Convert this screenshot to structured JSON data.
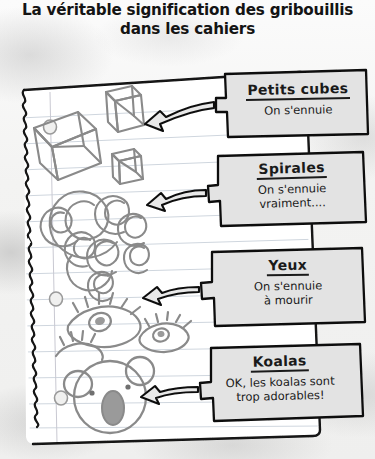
{
  "title": {
    "line1": "La véritable signification des gribouillis",
    "line2": "dans les cahiers",
    "full": "La véritable signification des gribouillis\ndans les cahiers"
  },
  "colors": {
    "ink": "#1a1a1a",
    "pencil": "#8a8a8a",
    "rule_line": "#cfd6de",
    "margin_line": "#c9c9d2",
    "paper": "#ffffff",
    "box_fill": "#e3e3e3",
    "background": "#f2f2f1"
  },
  "notebook": {
    "name": "torn-notebook-page",
    "ruled_lines": 13,
    "punch_holes": 2,
    "torn_edge": "left"
  },
  "doodles": [
    {
      "id": "cubes",
      "name": "cube-doodle",
      "label": "Petits cubes",
      "count": 3
    },
    {
      "id": "spirals",
      "name": "spiral-doodle",
      "label": "Spirales",
      "count": 9
    },
    {
      "id": "eyes",
      "name": "eye-doodle",
      "label": "Yeux",
      "count": 3
    },
    {
      "id": "koala",
      "name": "koala-doodle",
      "label": "Koalas",
      "count": 1
    }
  ],
  "callouts": [
    {
      "id": "cubes",
      "heading": "Petits cubes",
      "body": "On s'ennuie",
      "arrow": "arrow-to-cubes"
    },
    {
      "id": "spirals",
      "heading": "Spirales",
      "body": "On s'ennuie\nvraiment....",
      "arrow": "arrow-to-spirals"
    },
    {
      "id": "eyes",
      "heading": "Yeux",
      "body": "On s'ennuie\nà mourir",
      "arrow": "arrow-to-eyes"
    },
    {
      "id": "koalas",
      "heading": "Koalas",
      "body": "OK, les koalas sont\ntrop adorables!",
      "arrow": "arrow-to-koala"
    }
  ]
}
